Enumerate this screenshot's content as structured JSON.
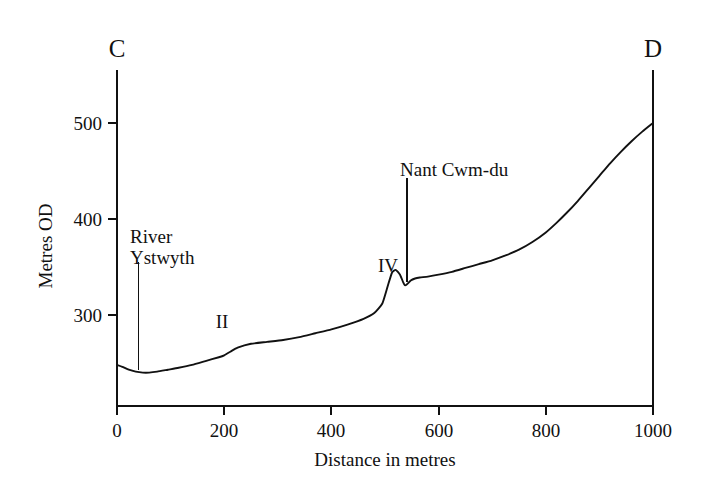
{
  "figure": {
    "name": "valley-cross-profile",
    "background_color": "#ffffff",
    "ink_color": "#111111"
  },
  "chart_data": {
    "type": "line",
    "title": "",
    "subtitle": "",
    "xlabel": "Distance in metres",
    "ylabel": "Metres OD",
    "xlim": [
      0,
      1000
    ],
    "ylim": [
      225,
      560
    ],
    "xticks": [
      0,
      200,
      400,
      600,
      800,
      1000
    ],
    "yticks": [
      300,
      400,
      500
    ],
    "xtick_labels": [
      "0",
      "200",
      "400",
      "600",
      "800",
      "1000"
    ],
    "ytick_labels": [
      "300",
      "400",
      "500"
    ],
    "grid": false,
    "legend": "none",
    "series": [
      {
        "name": "Ground surface profile C-D",
        "x": [
          0,
          10,
          22,
          35,
          48,
          60,
          75,
          95,
          115,
          140,
          165,
          190,
          200,
          212,
          225,
          250,
          280,
          310,
          340,
          370,
          400,
          430,
          460,
          480,
          495,
          505,
          513,
          520,
          528,
          534,
          537,
          541,
          548,
          556,
          565,
          580,
          600,
          625,
          650,
          675,
          700,
          725,
          750,
          775,
          800,
          820,
          840,
          860,
          880,
          900,
          920,
          940,
          960,
          980,
          1000
        ],
        "y": [
          248,
          246,
          243,
          241,
          240,
          240,
          241,
          243,
          245,
          248,
          252,
          256,
          258,
          262,
          266,
          270,
          272,
          274,
          277,
          281,
          285,
          290,
          296,
          302,
          312,
          330,
          344,
          347,
          342,
          334,
          331,
          332,
          336,
          338,
          339,
          340,
          342,
          345,
          349,
          353,
          357,
          362,
          368,
          376,
          386,
          396,
          407,
          419,
          432,
          445,
          458,
          470,
          481,
          491,
          500
        ]
      }
    ],
    "annotations": [
      {
        "id": "river-ystwyth",
        "label": "River\nYstwyth",
        "label_lines": [
          "River",
          "Ystwyth"
        ],
        "leader_x": 40,
        "leader_top_value": 355,
        "leader_bottom_value": 243,
        "note": "valley floor / river channel at ~40 m"
      },
      {
        "id": "nant-cwm-du",
        "label": "Nant Cwm-du",
        "label_lines": [
          "Nant Cwm-du"
        ],
        "leader_x": 541,
        "leader_top_value": 443,
        "leader_bottom_value": 334,
        "note": "tributary notch at ~540 m"
      },
      {
        "id": "terrace-ii",
        "label": "II",
        "label_x": 196,
        "label_value": 304,
        "note": "terrace fragment II"
      },
      {
        "id": "terrace-iv",
        "label": "IV",
        "label_x": 503,
        "label_value": 375,
        "note": "terrace fragment IV"
      }
    ],
    "endpoints": [
      {
        "id": "c",
        "label": "C",
        "x": 0,
        "note": "left section end marker, vertical tie line"
      },
      {
        "id": "d",
        "label": "D",
        "x": 1000,
        "note": "right section end marker, vertical tie line"
      }
    ]
  },
  "axes": {
    "x_axis_title": "Distance in metres",
    "y_axis_title": "Metres OD",
    "x_tick_labels": [
      "0",
      "200",
      "400",
      "600",
      "800",
      "1000"
    ],
    "y_tick_labels": [
      "300",
      "400",
      "500"
    ]
  },
  "labels": {
    "endpoint_c": "C",
    "endpoint_d": "D",
    "river_ystwyth_line1": "River",
    "river_ystwyth_line2": "Ystwyth",
    "nant_cwm_du": "Nant Cwm-du",
    "terrace_two": "II",
    "terrace_four": "IV"
  }
}
